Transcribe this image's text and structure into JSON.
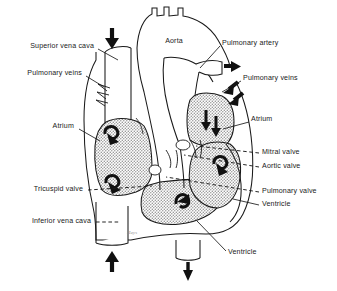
{
  "figure": {
    "signature": "Hays"
  },
  "colors": {
    "ink": "#1a1a1a",
    "chamber_fill": "#d9d9d9",
    "vessel_fill": "#ffffff",
    "background": "#ffffff",
    "label_text": "#1a1a1a"
  },
  "labels": [
    {
      "id": "superior-vena-cava",
      "text": "Superior vena cava",
      "side": "left",
      "x": 96,
      "y": 47,
      "leader_to_x": 118,
      "leader_to_y": 60,
      "leader": "solid"
    },
    {
      "id": "pulmonary-veins-left",
      "text": "Pulmonary veins",
      "side": "left",
      "x": 84,
      "y": 74,
      "leader_to_x": 103,
      "leader_to_y": 86,
      "leader": "solid"
    },
    {
      "id": "atrium-right-heart",
      "text": "Atrium",
      "side": "left",
      "x": 76,
      "y": 127,
      "leader_to_x": 99,
      "leader_to_y": 140,
      "leader": "solid"
    },
    {
      "id": "tricuspid-valve",
      "text": "Tricuspid valve",
      "side": "left",
      "x": 85,
      "y": 190,
      "leader_to_x": 150,
      "leader_to_y": 186,
      "leader": "dashed"
    },
    {
      "id": "inferior-vena-cava",
      "text": "Inferior vena cava",
      "side": "left",
      "x": 93,
      "y": 222,
      "leader_to_x": 118,
      "leader_to_y": 222,
      "leader": "dashed"
    },
    {
      "id": "aorta",
      "text": "Aorta",
      "side": "center",
      "x": 174,
      "y": 42,
      "leader": "none"
    },
    {
      "id": "pulmonary-artery",
      "text": "Pulmonary artery",
      "side": "right",
      "x": 222,
      "y": 44,
      "leader_to_x": 200,
      "leader_to_y": 68,
      "leader": "solid"
    },
    {
      "id": "pulmonary-veins-right",
      "text": "Pulmonary veins",
      "side": "right",
      "x": 243,
      "y": 79,
      "leader_to_x": 222,
      "leader_to_y": 92,
      "leader": "solid"
    },
    {
      "id": "atrium-left-heart",
      "text": "Atrium",
      "side": "right",
      "x": 251,
      "y": 120,
      "leader_to_x": 222,
      "leader_to_y": 128,
      "leader": "solid"
    },
    {
      "id": "mitral-valve",
      "text": "Mitral valve",
      "side": "right",
      "x": 262,
      "y": 153,
      "leader_to_x": 198,
      "leader_to_y": 147,
      "leader": "dashed"
    },
    {
      "id": "aortic-valve",
      "text": "Aortic valve",
      "side": "right",
      "x": 262,
      "y": 167,
      "leader_to_x": 184,
      "leader_to_y": 156,
      "leader": "dashed"
    },
    {
      "id": "pulmonary-valve",
      "text": "Pulmonary valve",
      "side": "right",
      "x": 262,
      "y": 192,
      "leader_to_x": 167,
      "leader_to_y": 178,
      "leader": "dashed"
    },
    {
      "id": "ventricle-left-heart",
      "text": "Ventricle",
      "side": "right",
      "x": 262,
      "y": 205,
      "leader_to_x": 232,
      "leader_to_y": 199,
      "leader": "solid"
    },
    {
      "id": "ventricle-right-heart",
      "text": "Ventricle",
      "side": "right",
      "x": 228,
      "y": 253,
      "leader_to_x": 197,
      "leader_to_y": 222,
      "leader": "solid"
    }
  ],
  "flow_arrows": [
    {
      "id": "inflow-superior-vena-cava",
      "kind": "straight",
      "direction": "down",
      "x": 112,
      "y": 39
    },
    {
      "id": "inflow-inferior-vena-cava",
      "kind": "straight",
      "direction": "up",
      "x": 113,
      "y": 258
    },
    {
      "id": "outflow-pulmonary-artery",
      "kind": "straight",
      "direction": "right",
      "x": 227,
      "y": 66
    },
    {
      "id": "outflow-aorta-descending",
      "kind": "straight",
      "direction": "down",
      "x": 189,
      "y": 271
    },
    {
      "id": "inflow-pulmonary-vein-upper",
      "kind": "straight",
      "direction": "down-left",
      "x": 222,
      "y": 90
    },
    {
      "id": "inflow-pulmonary-vein-lower",
      "kind": "straight",
      "direction": "down-left",
      "x": 227,
      "y": 100
    },
    {
      "id": "swirl-right-atrium-upper",
      "kind": "curved",
      "x": 112,
      "y": 132
    },
    {
      "id": "swirl-right-atrium-lower",
      "kind": "curved",
      "x": 113,
      "y": 181
    },
    {
      "id": "swirl-left-atrium-left",
      "kind": "curved",
      "x": 207,
      "y": 117
    },
    {
      "id": "swirl-left-atrium-right",
      "kind": "curved",
      "x": 216,
      "y": 124
    },
    {
      "id": "swirl-left-ventricle",
      "kind": "curved",
      "x": 220,
      "y": 170
    },
    {
      "id": "swirl-right-ventricle",
      "kind": "curved",
      "x": 180,
      "y": 198
    }
  ],
  "regions": [
    {
      "id": "right-atrium-chamber",
      "name": "Right atrium (shaded chamber, viewer left)"
    },
    {
      "id": "right-ventricle-chamber",
      "name": "Right ventricle (shaded chamber, lower center)"
    },
    {
      "id": "left-atrium-chamber",
      "name": "Left atrium (shaded chamber, viewer right upper)"
    },
    {
      "id": "left-ventricle-chamber",
      "name": "Left ventricle (shaded chamber, viewer right lower)"
    },
    {
      "id": "aorta-vessel",
      "name": "Aorta with arch and branch vessels"
    },
    {
      "id": "pulmonary-artery-vessel",
      "name": "Pulmonary artery trunk"
    },
    {
      "id": "superior-vena-cava-vessel",
      "name": "Superior vena cava"
    },
    {
      "id": "inferior-vena-cava-vessel",
      "name": "Inferior vena cava"
    }
  ]
}
